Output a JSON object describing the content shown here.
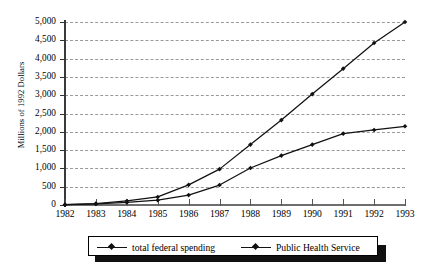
{
  "chart_data": {
    "type": "line",
    "title": "",
    "xlabel": "",
    "ylabel": "Millions of 1992 Dollars",
    "categories": [
      "1982",
      "1983",
      "1984",
      "1985",
      "1986",
      "1987",
      "1988",
      "1989",
      "1990",
      "1991",
      "1992",
      "1993"
    ],
    "xlim": [
      1982,
      1993
    ],
    "ylim": [
      0,
      5000
    ],
    "ytick_labels": [
      "0",
      "500",
      "1,000",
      "1,500",
      "2,000",
      "2,500",
      "3,000",
      "3,500",
      "4,000",
      "4,500",
      "5,000"
    ],
    "ytick_values": [
      0,
      500,
      1000,
      1500,
      2000,
      2500,
      3000,
      3500,
      4000,
      4500,
      5000
    ],
    "grid": "horizontal-dashed",
    "legend_position": "bottom",
    "series": [
      {
        "name": "total federal spending",
        "color": "#111111",
        "marker": "diamond",
        "values": [
          10,
          40,
          110,
          220,
          550,
          980,
          1650,
          2320,
          3030,
          3725,
          4425,
          5000
        ]
      },
      {
        "name": "Public Health Service",
        "color": "#111111",
        "marker": "diamond",
        "values": [
          8,
          30,
          70,
          130,
          270,
          545,
          1010,
          1350,
          1650,
          1950,
          2050,
          2150
        ]
      }
    ]
  },
  "legend": {
    "items": [
      {
        "label": "total federal spending"
      },
      {
        "label": "Public Health Service"
      }
    ]
  },
  "axes": {
    "y_title": "Millions of 1992 Dollars"
  }
}
